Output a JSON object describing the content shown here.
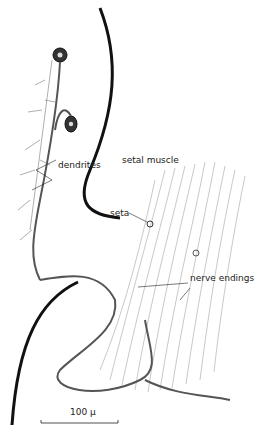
{
  "figure": {
    "type": "scientific-illustration",
    "labels": {
      "dendrites": "dendrites",
      "setal_muscle": "setal muscle",
      "seta": "seta",
      "nerve_endings": "nerve endings"
    },
    "scale_bar": {
      "label": "100 µ"
    },
    "colors": {
      "ink": "#111111",
      "nerve": "#555555",
      "muscle_fibers": "#aaaaaa",
      "background": "#ffffff"
    }
  }
}
